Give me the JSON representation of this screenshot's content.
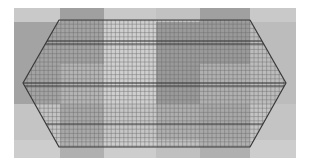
{
  "figure": {
    "title": "",
    "type": "computational-mesh-over-field",
    "canvas": {
      "width": 309,
      "height": 167,
      "background": "#ffffff"
    },
    "plot_area": {
      "x": 14,
      "y": 8,
      "width": 282,
      "height": 150
    }
  },
  "background_field": {
    "description": "checkerboard grayscale field of piecewise-constant blocks",
    "column_edges": [
      0,
      46,
      90,
      142,
      186,
      236,
      282
    ],
    "row_edges": [
      0,
      14,
      56,
      96,
      132,
      150
    ],
    "blocks": [
      [
        "#c9c9c9",
        "#a0a0a0",
        "#c9c9c9",
        "#c2c2c2",
        "#a0a0a0",
        "#c9c9c9"
      ],
      [
        "#a3a3a3",
        "#a3a3a3",
        "#cfcfcf",
        "#9a9a9a",
        "#9a9a9a",
        "#bcbcbc"
      ],
      [
        "#a3a3a3",
        "#b4b4b4",
        "#cfcfcf",
        "#9a9a9a",
        "#b0b0b0",
        "#bcbcbc"
      ],
      [
        "#c4c4c4",
        "#a8a8a8",
        "#c6c6c6",
        "#aeaeae",
        "#a8a8a8",
        "#c4c4c4"
      ],
      [
        "#cdcdcd",
        "#b0b0b0",
        "#cdcdcd",
        "#c0c0c0",
        "#b0b0b0",
        "#cdcdcd"
      ]
    ]
  },
  "mesh": {
    "outline_shape": "hexagon",
    "outline_color": "#3a3a3a",
    "outline_width": 1.2,
    "vertices": [
      {
        "x": 45,
        "y": 12
      },
      {
        "x": 236,
        "y": 12
      },
      {
        "x": 272,
        "y": 75
      },
      {
        "x": 236,
        "y": 139
      },
      {
        "x": 45,
        "y": 139
      },
      {
        "x": 9,
        "y": 75
      }
    ],
    "grid_line_color": "#6e6e6e",
    "grid_line_width": 0.45,
    "cell_size_x": 4.2,
    "cell_size_y": 4.2,
    "n_columns": 63,
    "n_rows": 30,
    "emphasized_rows_y": [
      33,
      36,
      75,
      78,
      116
    ],
    "emphasized_line_color": "#303030",
    "emphasized_line_width": 0.9
  },
  "labels": {
    "axis_x": "",
    "axis_y": "",
    "legend": [],
    "annotations": []
  }
}
